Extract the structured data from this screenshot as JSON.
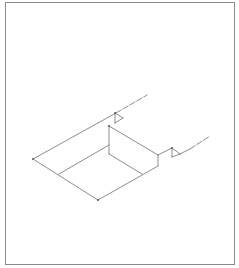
{
  "drawing": {
    "title": "",
    "line_color": "#6e6e6e",
    "frame_color": "#8a8a8a",
    "elements": [
      "isometric-floor-outline",
      "raised-block",
      "step-with-dimension-marks",
      "extension-lines"
    ]
  }
}
